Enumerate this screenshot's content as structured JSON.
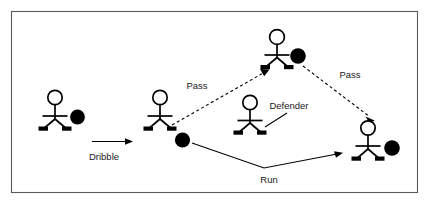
{
  "diagram": {
    "frame": {
      "border_color": "#5a5a5a",
      "background_color": "#ffffff"
    },
    "palette": {
      "ink": "#000000",
      "label_text": "#1a1a1a",
      "ball_fill": "#000000",
      "head_fill": "#ffffff"
    },
    "players": [
      {
        "id": "player-left",
        "name": "stick-figure-left",
        "has_ball": true,
        "x": 55,
        "y": 108
      },
      {
        "id": "player-mid",
        "name": "stick-figure-mid-left",
        "has_ball": true,
        "x": 160,
        "y": 108
      },
      {
        "id": "player-defender",
        "name": "stick-figure-defender",
        "has_ball": false,
        "x": 250,
        "y": 113
      },
      {
        "id": "player-top",
        "name": "stick-figure-top",
        "has_ball": true,
        "x": 277,
        "y": 37
      },
      {
        "id": "player-right",
        "name": "stick-figure-right",
        "has_ball": true,
        "x": 368,
        "y": 138
      }
    ],
    "labels": [
      {
        "id": "dribble",
        "text": "Dribble",
        "x": 104,
        "y": 157
      },
      {
        "id": "pass-up",
        "text": "Pass",
        "x": 197,
        "y": 86
      },
      {
        "id": "pass-down",
        "text": "Pass",
        "x": 350,
        "y": 75
      },
      {
        "id": "defender",
        "text": "Defender",
        "x": 289,
        "y": 106
      },
      {
        "id": "run",
        "text": "Run",
        "x": 269,
        "y": 180
      }
    ],
    "connectors": [
      {
        "id": "dribble-arrow",
        "kind": "solid",
        "label": "Dribble",
        "from": "player-left",
        "to": "player-mid"
      },
      {
        "id": "pass-up-arrow",
        "kind": "dashed",
        "label": "Pass",
        "from": "player-mid",
        "to": "player-top"
      },
      {
        "id": "pass-down-arrow",
        "kind": "dashed",
        "label": "Pass",
        "from": "player-top",
        "to": "player-right"
      },
      {
        "id": "run-arrow",
        "kind": "solid",
        "label": "Run",
        "from": "player-mid",
        "to": "player-right"
      },
      {
        "id": "defender-leader",
        "kind": "leader",
        "label": "Defender",
        "from": "defender",
        "to": "player-defender"
      }
    ]
  }
}
